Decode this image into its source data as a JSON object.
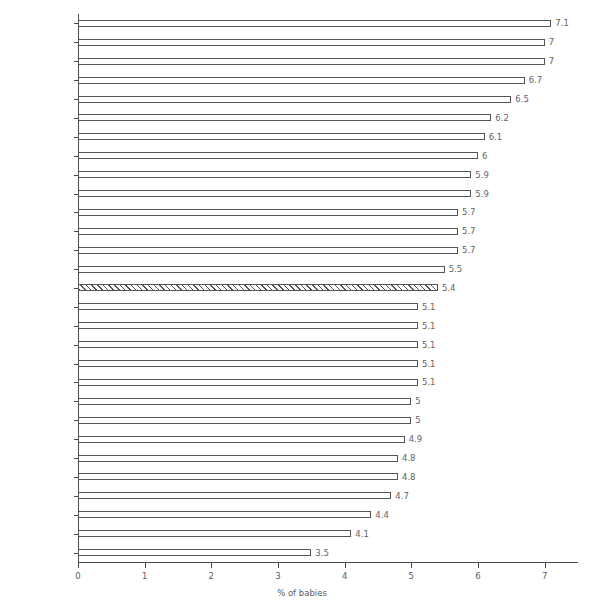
{
  "chart_data": {
    "type": "bar",
    "orientation": "horizontal",
    "title": "",
    "subtitle": "",
    "xlabel": "% of babies",
    "ylabel": "",
    "xlim": [
      0,
      7.5
    ],
    "xticks": [
      0,
      1,
      2,
      3,
      4,
      5,
      6,
      7
    ],
    "xtick_labels": [
      "0",
      "1",
      "2",
      "3",
      "4",
      "5",
      "6",
      "7"
    ],
    "grid": false,
    "legend": null,
    "highlight_category": "State",
    "highlight_style": "hatched",
    "categories": [
      "Roscommon",
      "Waterford",
      "Longford",
      "Kilkenny",
      "Offaly",
      "Wicklow",
      "Limerick",
      "Tipperary SR",
      "Kerry",
      "Laois",
      "Cavan",
      "Meath",
      "Dublin",
      "Monaghan",
      "State",
      "Wexford",
      "Donegal",
      "Louth",
      "Clare",
      "Westmeath",
      "Mayo",
      "Sligo",
      "Carlow",
      "Cork",
      "Dublin County",
      "Galway",
      "Kildare",
      "Tipperary NR",
      "Leitrim"
    ],
    "values": [
      7.1,
      7,
      7,
      6.7,
      6.5,
      6.2,
      6.1,
      6,
      5.9,
      5.9,
      5.7,
      5.7,
      5.7,
      5.5,
      5.4,
      5.1,
      5.1,
      5.1,
      5.1,
      5.1,
      5,
      5,
      4.9,
      4.8,
      4.8,
      4.7,
      4.4,
      4.1,
      3.5
    ],
    "value_labels": [
      "7.1",
      "7",
      "7",
      "6.7",
      "6.5",
      "6.2",
      "6.1",
      "6",
      "5.9",
      "5.9",
      "5.7",
      "5.7",
      "5.7",
      "5.5",
      "5.4",
      "5.1",
      "5.1",
      "5.1",
      "5.1",
      "5.1",
      "5",
      "5",
      "4.9",
      "4.8",
      "4.8",
      "4.7",
      "4.4",
      "4.1",
      "3.5"
    ],
    "colors": {
      "bar_fill": "#ffffff",
      "bar_stroke": "#555555",
      "axis": "#4a4a4a",
      "text": "#5c5c5c",
      "background": "#ffffff"
    }
  }
}
